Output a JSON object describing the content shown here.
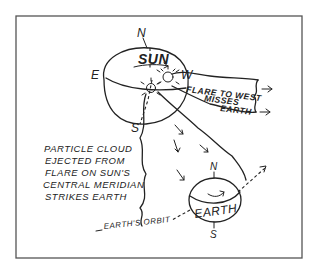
{
  "diagram": {
    "sun": {
      "label": "SUN",
      "poles": {
        "north": "N",
        "south": "S",
        "east": "E",
        "west": "W"
      }
    },
    "earth": {
      "label": "EARTH",
      "poles": {
        "north": "N",
        "south": "S"
      }
    },
    "annotations": {
      "flare_west_line1": "FLARE TO WEST",
      "flare_west_line2": "MISSES",
      "flare_west_line3": "EARTH",
      "cloud_line1": "PARTICLE CLOUD",
      "cloud_line2": "EJECTED FROM",
      "cloud_line3": "FLARE ON SUN'S",
      "cloud_line4": "CENTRAL MERIDIAN",
      "cloud_line5": "STRIKES EARTH",
      "orbit": "EARTH'S ORBIT"
    },
    "colors": {
      "ink": "#222222",
      "background": "#ffffff",
      "frame": "#555555"
    }
  }
}
